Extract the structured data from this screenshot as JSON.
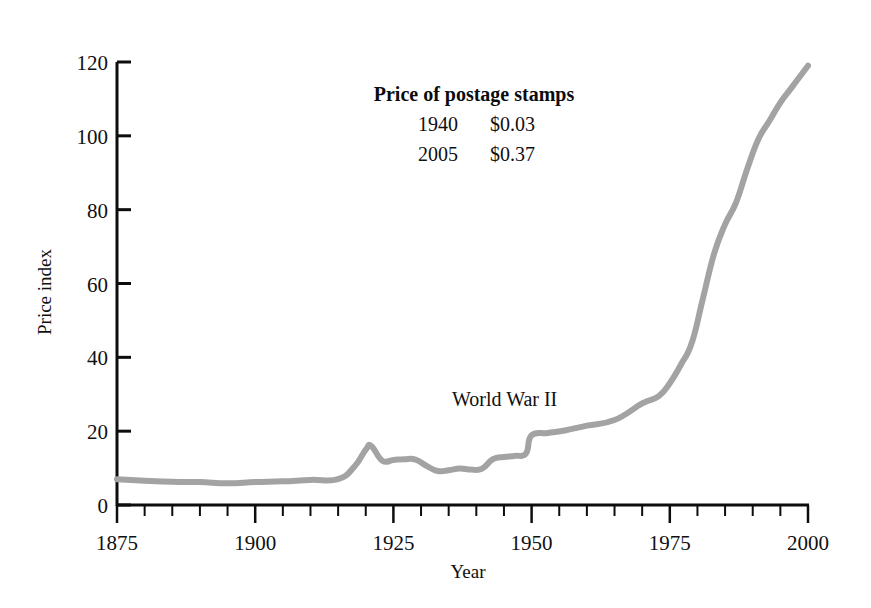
{
  "chart_data": {
    "type": "line",
    "title": "",
    "xlabel": "Year",
    "ylabel": "Price index",
    "xlim": [
      1875,
      2000
    ],
    "ylim": [
      0,
      120
    ],
    "grid": false,
    "legend": null,
    "xticks": [
      1875,
      1900,
      1925,
      1950,
      1975,
      2000
    ],
    "xtick_labels": [
      "1875",
      "1900",
      "1925",
      "1950",
      "1975",
      "2000"
    ],
    "xminor_step": 5,
    "yticks": [
      0,
      20,
      40,
      60,
      80,
      100,
      120
    ],
    "ytick_labels": [
      "0",
      "20",
      "40",
      "60",
      "80",
      "100",
      "120"
    ],
    "line_color": "#a3a3a3",
    "line_width": 6,
    "series": [
      {
        "name": "Consumer price index",
        "x": [
          1875,
          1880,
          1885,
          1890,
          1895,
          1900,
          1905,
          1910,
          1915,
          1918,
          1920,
          1921,
          1923,
          1925,
          1927,
          1929,
          1931,
          1933,
          1935,
          1937,
          1939,
          1941,
          1943,
          1945,
          1947,
          1949,
          1950,
          1953,
          1956,
          1960,
          1965,
          1970,
          1973,
          1975,
          1977,
          1979,
          1981,
          1983,
          1985,
          1987,
          1989,
          1991,
          1993,
          1995,
          1997,
          2000
        ],
        "y": [
          7.0,
          6.6,
          6.3,
          6.2,
          5.9,
          6.2,
          6.4,
          6.8,
          7.0,
          10.5,
          15.0,
          16.0,
          12.0,
          12.2,
          12.4,
          12.3,
          10.6,
          9.2,
          9.4,
          9.9,
          9.6,
          9.8,
          12.4,
          13.0,
          13.3,
          14.0,
          18.9,
          19.5,
          20.2,
          21.5,
          23.0,
          27.5,
          29.5,
          33.0,
          38.0,
          44.0,
          56.0,
          68.0,
          76.0,
          82.0,
          91.0,
          99.0,
          104.0,
          109.0,
          113.0,
          119.0
        ]
      }
    ],
    "annotations": [
      {
        "name": "world-war-ii-label",
        "text": "World War II",
        "x_px": 452,
        "y_px": 406
      }
    ],
    "callout": {
      "title": "Price of postage stamps",
      "rows": [
        {
          "year": "1940",
          "price": "$0.03"
        },
        {
          "year": "2005",
          "price": "$0.37"
        }
      ]
    }
  }
}
